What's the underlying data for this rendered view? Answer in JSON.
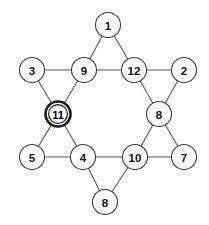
{
  "diagram": {
    "type": "star-of-david-graph",
    "canvas": {
      "width": 209,
      "height": 225
    },
    "style": {
      "background_color": "#ffffff",
      "edge_color": "#5b5b5b",
      "node_fill": "#ffffff",
      "node_stroke": "#3d3d3d",
      "highlight_stroke": "#1a1a1a",
      "label_color": "#111111",
      "node_radius": 12.5
    },
    "nodes": [
      {
        "id": "n1",
        "label": "1",
        "x": 108,
        "y": 25,
        "r": 12.5,
        "highlighted": false,
        "position": "top-point"
      },
      {
        "id": "n3",
        "label": "3",
        "x": 32,
        "y": 70,
        "r": 12.5,
        "highlighted": false,
        "position": "upper-left-point"
      },
      {
        "id": "n9",
        "label": "9",
        "x": 84,
        "y": 70,
        "r": 12.5,
        "highlighted": false,
        "position": "hex-upper-left"
      },
      {
        "id": "n12",
        "label": "12",
        "x": 134,
        "y": 70,
        "r": 12.5,
        "highlighted": false,
        "position": "hex-upper-right"
      },
      {
        "id": "n2",
        "label": "2",
        "x": 184,
        "y": 70,
        "r": 12.5,
        "highlighted": false,
        "position": "upper-right-point"
      },
      {
        "id": "n11",
        "label": "11",
        "x": 58,
        "y": 114,
        "r": 12.5,
        "highlighted": true,
        "position": "hex-left"
      },
      {
        "id": "n8r",
        "label": "8",
        "x": 159,
        "y": 114,
        "r": 12.5,
        "highlighted": false,
        "position": "hex-right"
      },
      {
        "id": "n5",
        "label": "5",
        "x": 32,
        "y": 157,
        "r": 12.5,
        "highlighted": false,
        "position": "lower-left-point"
      },
      {
        "id": "n4",
        "label": "4",
        "x": 83,
        "y": 157,
        "r": 12.5,
        "highlighted": false,
        "position": "hex-lower-left"
      },
      {
        "id": "n10",
        "label": "10",
        "x": 135,
        "y": 157,
        "r": 12.5,
        "highlighted": false,
        "position": "hex-lower-right"
      },
      {
        "id": "n7",
        "label": "7",
        "x": 184,
        "y": 157,
        "r": 12.5,
        "highlighted": false,
        "position": "lower-right-point"
      },
      {
        "id": "n8b",
        "label": "8",
        "x": 105,
        "y": 202,
        "r": 12.5,
        "highlighted": false,
        "position": "bottom-point"
      }
    ],
    "edges": [
      {
        "from": "n1",
        "to": "n9"
      },
      {
        "from": "n1",
        "to": "n12"
      },
      {
        "from": "n9",
        "to": "n12"
      },
      {
        "from": "n3",
        "to": "n9"
      },
      {
        "from": "n3",
        "to": "n11"
      },
      {
        "from": "n9",
        "to": "n11"
      },
      {
        "from": "n12",
        "to": "n2"
      },
      {
        "from": "n2",
        "to": "n8r"
      },
      {
        "from": "n12",
        "to": "n8r"
      },
      {
        "from": "n11",
        "to": "n4"
      },
      {
        "from": "n11",
        "to": "n5"
      },
      {
        "from": "n5",
        "to": "n4"
      },
      {
        "from": "n8r",
        "to": "n10"
      },
      {
        "from": "n8r",
        "to": "n7"
      },
      {
        "from": "n10",
        "to": "n7"
      },
      {
        "from": "n4",
        "to": "n10"
      },
      {
        "from": "n4",
        "to": "n8b"
      },
      {
        "from": "n10",
        "to": "n8b"
      }
    ]
  }
}
